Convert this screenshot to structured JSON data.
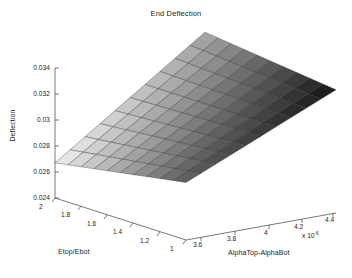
{
  "figure": {
    "title": "End Deflection",
    "background": "#ffffff",
    "width": 352,
    "height": 278
  },
  "axes": {
    "z": {
      "label": "Deflection",
      "ticks": [
        "0.024",
        "0.026",
        "0.028",
        "0.03",
        "0.032",
        "0.034"
      ],
      "range": [
        0.024,
        0.034
      ]
    },
    "x": {
      "label": "Etop/Ebot",
      "ticks": [
        "2",
        "1.8",
        "1.6",
        "1.4",
        "1.2",
        "1"
      ],
      "range": [
        1,
        2
      ]
    },
    "y": {
      "label": "AlphaTop-AlphaBot",
      "ticks": [
        "3.6",
        "3.8",
        "4",
        "4.2",
        "4.4"
      ],
      "exponent_prefix": "x 10",
      "exponent_value": "-6",
      "range": [
        3.5,
        4.5
      ]
    }
  },
  "chart_data": {
    "type": "surface",
    "title": "End Deflection",
    "xlabel": "Etop/Ebot",
    "ylabel": "AlphaTop-AlphaBot",
    "zlabel": "Deflection",
    "colormap": "gray",
    "shading": "faceted",
    "grid": false,
    "view": "3d",
    "x": [
      1.0,
      1.1,
      1.2,
      1.3,
      1.4,
      1.5,
      1.6,
      1.7,
      1.8,
      1.9,
      2.0
    ],
    "y": [
      3.5e-06,
      3.6e-06,
      3.7e-06,
      3.8e-06,
      3.9e-06,
      4e-06,
      4.1e-06,
      4.2e-06,
      4.3e-06,
      4.4e-06,
      4.5e-06
    ],
    "zlim": [
      0.024,
      0.034
    ],
    "z": [
      [
        0.0248,
        0.0254,
        0.026,
        0.0266,
        0.0272,
        0.0278,
        0.0284,
        0.029,
        0.0296,
        0.0302,
        0.0308
      ],
      [
        0.0251,
        0.0257,
        0.0263,
        0.0269,
        0.0275,
        0.0281,
        0.0287,
        0.0293,
        0.0299,
        0.0305,
        0.0311
      ],
      [
        0.0254,
        0.026,
        0.0266,
        0.0272,
        0.0278,
        0.0284,
        0.029,
        0.0296,
        0.0302,
        0.0308,
        0.0314
      ],
      [
        0.0257,
        0.0263,
        0.0269,
        0.0275,
        0.0281,
        0.0287,
        0.0293,
        0.0299,
        0.0305,
        0.0311,
        0.0317
      ],
      [
        0.026,
        0.0266,
        0.0272,
        0.0278,
        0.0284,
        0.029,
        0.0296,
        0.0302,
        0.0308,
        0.0314,
        0.032
      ],
      [
        0.0263,
        0.0269,
        0.0275,
        0.0281,
        0.0287,
        0.0293,
        0.0299,
        0.0305,
        0.0311,
        0.0317,
        0.0323
      ],
      [
        0.0266,
        0.0272,
        0.0278,
        0.0284,
        0.029,
        0.0296,
        0.0302,
        0.0308,
        0.0314,
        0.032,
        0.0326
      ],
      [
        0.0269,
        0.0275,
        0.0281,
        0.0287,
        0.0293,
        0.0299,
        0.0305,
        0.0311,
        0.0317,
        0.0323,
        0.0329
      ],
      [
        0.0272,
        0.0278,
        0.0284,
        0.029,
        0.0296,
        0.0302,
        0.0308,
        0.0314,
        0.032,
        0.0326,
        0.0332
      ],
      [
        0.0275,
        0.0281,
        0.0287,
        0.0293,
        0.0299,
        0.0305,
        0.0311,
        0.0317,
        0.0323,
        0.0329,
        0.0335
      ],
      [
        0.0278,
        0.0284,
        0.029,
        0.0296,
        0.0302,
        0.0308,
        0.0314,
        0.032,
        0.0326,
        0.0332,
        0.0338
      ]
    ]
  },
  "geometry": {
    "comment": "Projected 2D pixel anchors used to draw the 3D box and surface.",
    "origin_front": [
      88,
      210
    ],
    "corner_left": [
      55,
      198
    ],
    "corner_right": [
      336,
      189
    ],
    "z_axis_top": [
      55,
      68
    ],
    "surface_corners": {
      "near_left": [
        55,
        166
      ],
      "near_right": [
        186,
        209
      ],
      "far_right": [
        336,
        128
      ],
      "far_left": [
        205,
        47
      ]
    }
  }
}
